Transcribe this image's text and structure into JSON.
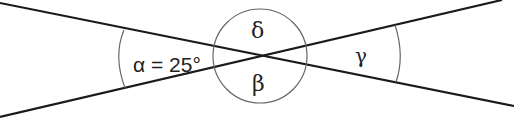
{
  "diagram": {
    "labels": {
      "alpha": "α = 25°",
      "beta": "β",
      "gamma": "γ",
      "delta": "δ"
    },
    "given": {
      "alpha_degrees": 25
    },
    "colors": {
      "line": "#1a1a1a",
      "arc": "#666666",
      "background": "#ffffff"
    }
  }
}
